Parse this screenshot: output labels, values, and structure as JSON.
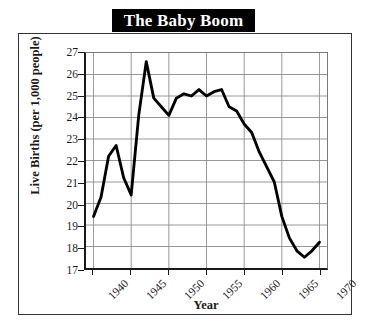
{
  "chart_data": {
    "type": "line",
    "title": "The Baby Boom",
    "xlabel": "Year",
    "ylabel": "Live Births (per 1,000 people)",
    "xlim": [
      1939.0,
      1971.0
    ],
    "ylim": [
      17,
      27
    ],
    "ytick_labels": [
      "27",
      "26",
      "25",
      "24",
      "23",
      "22",
      "21",
      "20",
      "19",
      "18",
      "17"
    ],
    "ytick_values": [
      27,
      26,
      25,
      24,
      23,
      22,
      21,
      20,
      19,
      18,
      17
    ],
    "xtick_labels": [
      "1940",
      "1945",
      "1950",
      "1955",
      "1960",
      "1965",
      "1970"
    ],
    "xtick_values": [
      1940,
      1945,
      1950,
      1955,
      1960,
      1965,
      1970
    ],
    "grid": true,
    "legend": null,
    "line_color": "#000000",
    "grid_color": "#8c8c8c",
    "title_background": "#000000",
    "title_color": "#ffffff",
    "series": [
      {
        "name": "Live Births",
        "x": [
          1940,
          1941,
          1942,
          1943,
          1944,
          1945,
          1946,
          1947,
          1948,
          1949,
          1950,
          1951,
          1952,
          1953,
          1954,
          1955,
          1956,
          1957,
          1958,
          1959,
          1960,
          1961,
          1962,
          1963,
          1964,
          1965,
          1966,
          1967,
          1968,
          1969,
          1970
        ],
        "values": [
          19.4,
          20.3,
          22.2,
          22.7,
          21.2,
          20.4,
          24.1,
          26.6,
          24.9,
          24.5,
          24.1,
          24.9,
          25.1,
          25.0,
          25.3,
          25.0,
          25.2,
          25.3,
          24.5,
          24.3,
          23.7,
          23.3,
          22.4,
          21.7,
          21.0,
          19.4,
          18.4,
          17.8,
          17.5,
          17.8,
          18.2
        ]
      }
    ]
  },
  "figure": {
    "title": "The Baby Boom"
  }
}
